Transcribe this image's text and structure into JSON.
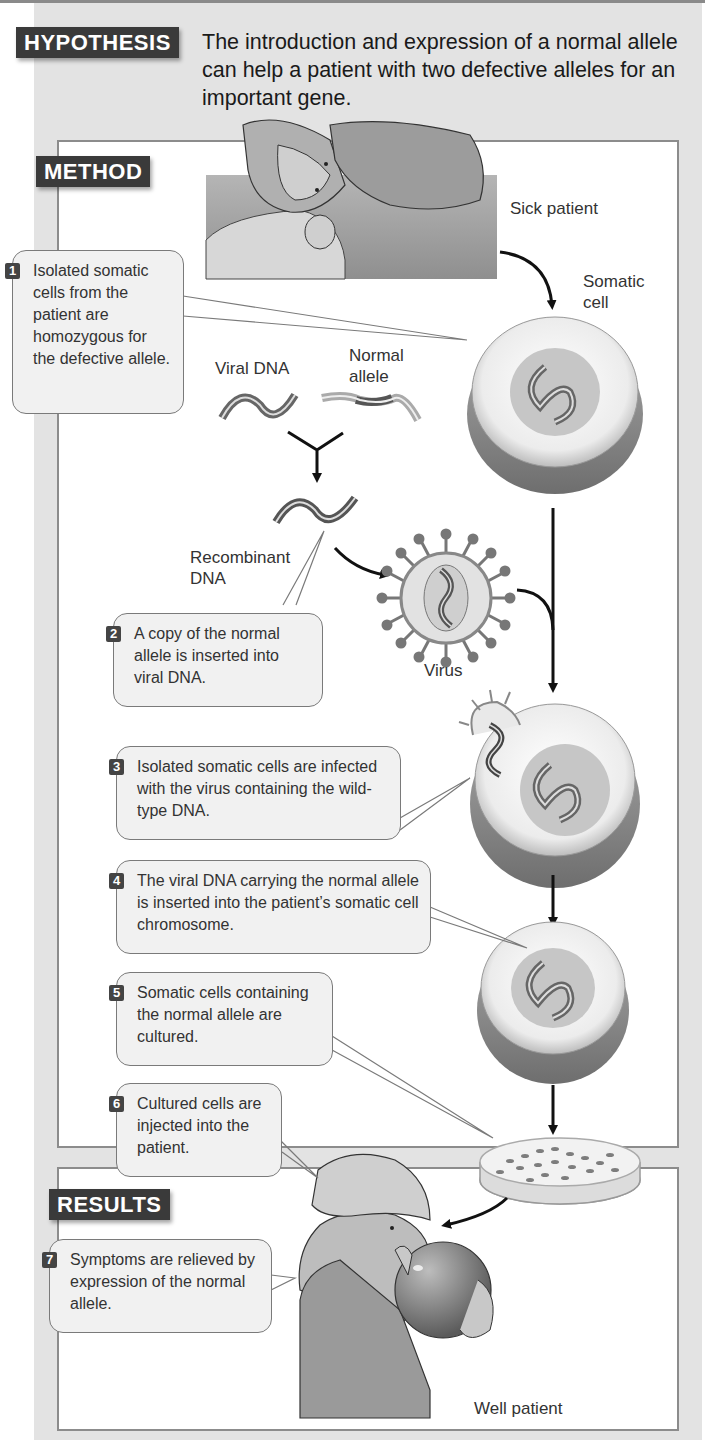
{
  "hypothesis": {
    "tag": "HYPOTHESIS",
    "text": "The introduction and expression of a normal allele can help a patient with two defective alleles for an important gene."
  },
  "method": {
    "tag": "METHOD",
    "labels": {
      "sick_patient": "Sick patient",
      "somatic_cell": "Somatic cell",
      "viral_dna": "Viral DNA",
      "normal_allele": "Normal allele",
      "recombinant_dna": "Recombinant DNA",
      "virus": "Virus"
    },
    "steps": [
      {
        "number": "1",
        "text": "Isolated somatic cells from the patient are homozygous for the defective allele."
      },
      {
        "number": "2",
        "text": "A copy of the normal allele is inserted into viral DNA."
      },
      {
        "number": "3",
        "text": "Isolated somatic cells are infected with the virus containing the wild-type DNA."
      },
      {
        "number": "4",
        "text": "The viral DNA carrying the normal allele is inserted into the patient’s somatic cell chromosome."
      },
      {
        "number": "5",
        "text": "Somatic cells containing the normal allele are cultured."
      },
      {
        "number": "6",
        "text": "Cultured cells are injected into the patient."
      }
    ]
  },
  "results": {
    "tag": "RESULTS",
    "labels": {
      "well_patient": "Well patient"
    },
    "steps": [
      {
        "number": "7",
        "text": "Symptoms are relieved by expression of the normal allele."
      }
    ]
  },
  "colors": {
    "panel_bg": "#e3e3e3",
    "tag_bg": "#3a3a3a",
    "callout_bg": "#f1f1f1",
    "border": "#8c8c8c"
  }
}
